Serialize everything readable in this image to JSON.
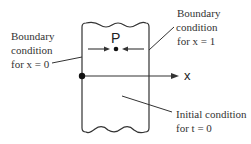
{
  "figure": {
    "point_label": "P",
    "axis_label": "x",
    "labels": {
      "left_boundary": {
        "line1": "Boundary",
        "line2": "condition",
        "line3": "for  x = 0"
      },
      "right_boundary": {
        "line1": "Boundary",
        "line2": "condition",
        "line3": "for  x = 1"
      },
      "initial": {
        "line1": "Initial condition",
        "line2": "for  t = 0"
      }
    },
    "colors": {
      "stroke": "#333333",
      "text": "#333333",
      "background": "#ffffff"
    }
  }
}
